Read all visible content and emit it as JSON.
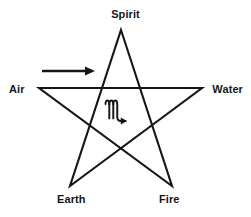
{
  "diagram": {
    "background_color": "#ffffff",
    "stroke_color": "#161616",
    "label_color": "#161616",
    "stroke_width": 2,
    "points": [
      {
        "key": "spirit",
        "label": "Spirit",
        "position": "top",
        "x": 121,
        "y": 30
      },
      {
        "key": "water",
        "label": "Water",
        "position": "right",
        "x": 202,
        "y": 88
      },
      {
        "key": "fire",
        "label": "Fire",
        "position": "bottom-right",
        "x": 172,
        "y": 186
      },
      {
        "key": "earth",
        "label": "Earth",
        "position": "bottom-left",
        "x": 70,
        "y": 186
      },
      {
        "key": "air",
        "label": "Air",
        "position": "left",
        "x": 39,
        "y": 88
      }
    ],
    "center_symbol": {
      "name": "scorpio-glyph",
      "glyph": "♏",
      "x": 121,
      "y": 114
    },
    "direction_arrow": {
      "name": "direction-arrow",
      "label": "",
      "direction": "right",
      "x_start": 42,
      "x_end": 95,
      "y": 71
    }
  }
}
